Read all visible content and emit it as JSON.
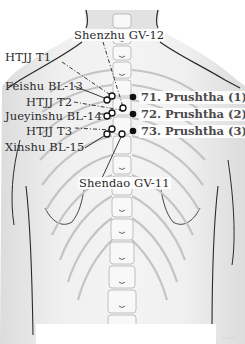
{
  "figure": {
    "colors": {
      "skin": "#ececec",
      "outline": "#2a2a2a",
      "bone": "#f6f6f6",
      "bone_outline": "#b8b8b8",
      "point_open": "#ffffff",
      "point_filled": "#111111",
      "text": "#2a2a2a",
      "prushtha_text": "#4a4a4a"
    }
  },
  "labels": {
    "shenzhu": "Shenzhu GV-12",
    "htjj_t1": "HTJJ T1",
    "feishu": "Feishu BL-13",
    "htjj_t2": "HTJJ T2",
    "jueyinshu": "Jueyinshu BL-14",
    "htjj_t3": "HTJJ T3",
    "xinshu": "Xinshu BL-15",
    "shendao": "Shendao GV-11"
  },
  "prushtha": [
    {
      "label": "71. Prushtha (1)"
    },
    {
      "label": "72. Prushtha (2)"
    },
    {
      "label": "73. Prushtha (3)"
    }
  ],
  "credit": "· · · ·"
}
